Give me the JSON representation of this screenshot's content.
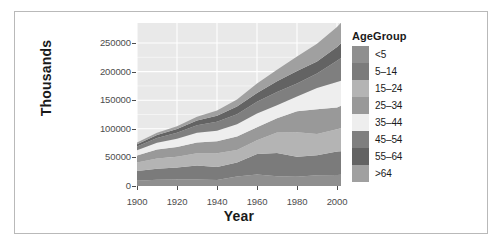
{
  "chart_data": {
    "type": "area",
    "stacked": true,
    "title": "",
    "subtitle": "",
    "xlabel": "Year",
    "ylabel": "Thousands",
    "xlim": [
      1900,
      2002
    ],
    "ylim": [
      0,
      285000
    ],
    "xticks": [
      1900,
      1920,
      1940,
      1960,
      1980,
      2000
    ],
    "yticks": [
      0,
      50000,
      100000,
      150000,
      200000,
      250000
    ],
    "xtick_labels": [
      "1900",
      "1920",
      "1940",
      "1960",
      "1980",
      "2000"
    ],
    "ytick_labels": [
      "0",
      "50000",
      "100000",
      "150000",
      "200000",
      "250000"
    ],
    "grid": true,
    "grid_color": "#ffffff",
    "panel_background": "#e9e9e9",
    "legend_title": "AgeGroup",
    "legend_position": "right",
    "x": [
      1900,
      1910,
      1920,
      1930,
      1940,
      1950,
      1960,
      1970,
      1980,
      1990,
      2000,
      2002
    ],
    "series": [
      {
        "name": "<5",
        "color": "#8f8f8f",
        "values": [
          9181,
          10909,
          11573,
          11444,
          10579,
          16410,
          20321,
          17166,
          16348,
          18758,
          19176,
          19597
        ]
      },
      {
        "name": "5-14",
        "color": "#7b7b7b",
        "values": [
          16966,
          19144,
          20828,
          24288,
          22452,
          24467,
          35465,
          40746,
          34942,
          35095,
          41078,
          41179
        ]
      },
      {
        "name": "15-24",
        "color": "#b4b4b4",
        "values": [
          14951,
          18143,
          18765,
          21345,
          24033,
          22098,
          24020,
          35441,
          42487,
          37013,
          39184,
          40404
        ]
      },
      {
        "name": "25-34",
        "color": "#999999",
        "values": [
          12161,
          15512,
          17202,
          19034,
          21339,
          23759,
          22818,
          24907,
          37082,
          43161,
          37678,
          39211
        ]
      },
      {
        "name": "35-44",
        "color": "#eeeeee",
        "values": [
          9273,
          11796,
          14141,
          17037,
          18333,
          21450,
          24081,
          23088,
          25635,
          37435,
          44659,
          43714
        ]
      },
      {
        "name": "45-54",
        "color": "#7f7f7f",
        "values": [
          6438,
          8448,
          10530,
          13072,
          15512,
          17343,
          20485,
          23220,
          22800,
          25057,
          37030,
          39633
        ]
      },
      {
        "name": "55-64",
        "color": "#636363",
        "values": [
          4026,
          5054,
          6532,
          8397,
          10572,
          13370,
          15572,
          18590,
          21703,
          21114,
          24275,
          26059
        ]
      },
      {
        "name": ">64",
        "color": "#a0a0a0",
        "values": [
          3080,
          3950,
          4933,
          6634,
          9019,
          12270,
          16560,
          20066,
          25549,
          31084,
          34992,
          35589
        ]
      }
    ]
  },
  "axes": {
    "y_title": "Thousands",
    "x_title": "Year"
  },
  "legend": {
    "title": "AgeGroup",
    "items": [
      {
        "label": "<5",
        "color": "#8f8f8f"
      },
      {
        "label": "5–14",
        "color": "#7b7b7b"
      },
      {
        "label": "15–24",
        "color": "#b4b4b4"
      },
      {
        "label": "25–34",
        "color": "#999999"
      },
      {
        "label": "35–44",
        "color": "#eeeeee"
      },
      {
        "label": "45–54",
        "color": "#7f7f7f"
      },
      {
        "label": "55–64",
        "color": "#636363"
      },
      {
        "label": ">64",
        "color": "#a0a0a0"
      }
    ]
  }
}
